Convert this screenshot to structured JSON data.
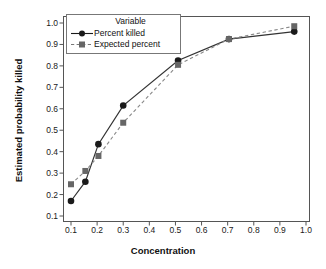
{
  "chart_data": {
    "type": "line",
    "title": "",
    "xlabel": "Concentration",
    "ylabel": "Estimated probability killed",
    "xlim": [
      0.1,
      1.0
    ],
    "ylim": [
      0.1,
      1.0
    ],
    "xticks": [
      "0.1",
      "0.2",
      "0.3",
      "0.4",
      "0.5",
      "0.6",
      "0.7",
      "0.8",
      "0.9",
      "1.0"
    ],
    "yticks": [
      "0.1",
      "0.2",
      "0.3",
      "0.4",
      "0.5",
      "0.6",
      "0.7",
      "0.8",
      "0.9",
      "1.0"
    ],
    "grid": false,
    "legend_position": "top-left",
    "legend_title": "Variable",
    "x": [
      0.1,
      0.155,
      0.205,
      0.3,
      0.51,
      0.705,
      0.955
    ],
    "series": [
      {
        "name": "Percent killed",
        "marker": "circle",
        "color": "#1a1a1a",
        "linestyle": "solid",
        "values": [
          0.17,
          0.26,
          0.435,
          0.615,
          0.825,
          0.925,
          0.96
        ]
      },
      {
        "name": "Expected percent",
        "marker": "square",
        "color": "#666666",
        "linestyle": "dashed",
        "values": [
          0.248,
          0.31,
          0.38,
          0.535,
          0.805,
          0.925,
          0.985
        ]
      }
    ]
  }
}
